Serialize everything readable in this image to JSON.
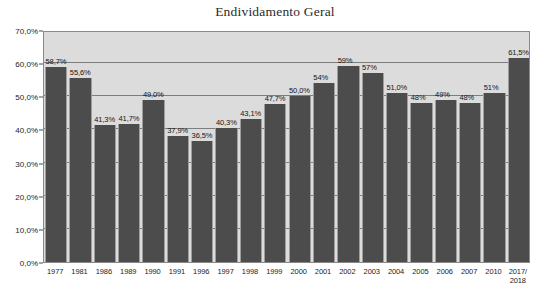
{
  "chart_data": {
    "type": "bar",
    "title": "Endividamento Geral",
    "xlabel": "",
    "ylabel": "",
    "ylim": [
      0,
      70
    ],
    "grid": true,
    "legend": false,
    "categories": [
      "1977",
      "1981",
      "1986",
      "1989",
      "1990",
      "1991",
      "1996",
      "1997",
      "1998",
      "1999",
      "2000",
      "2001",
      "2002",
      "2003",
      "2004",
      "2005",
      "2006",
      "2007",
      "2010",
      "2017/\n2018"
    ],
    "values": [
      58.7,
      55.6,
      41.3,
      41.7,
      49.0,
      37.9,
      36.5,
      40.3,
      43.1,
      47.7,
      50.0,
      54.0,
      59.0,
      57.0,
      51.0,
      48.0,
      49.0,
      48.0,
      51.0,
      61.5
    ],
    "data_labels": [
      "58,7%",
      "55,6%",
      "41,3%",
      "41,7%",
      "49,0%",
      "37,9%",
      "36,5%",
      "40,3%",
      "43,1%",
      "47,7%",
      "50,0%",
      "54%",
      "59%",
      "57%",
      "51,0%",
      "48%",
      "49%",
      "48%",
      "51%",
      "61,5%"
    ],
    "y_ticks": [
      "0,0%",
      "10,0%",
      "20,0%",
      "30,0%",
      "40,0%",
      "50,0%",
      "60,0%",
      "70,0%"
    ],
    "y_tick_values": [
      0,
      10,
      20,
      30,
      40,
      50,
      60,
      70
    ],
    "colors": {
      "bar": "#4c4c4c",
      "plot_background": "#dcdcdc",
      "gridline": "#7d7d7d",
      "axis": "#8a8a8a",
      "text": "#1c1c1c",
      "page_background": "#ffffff"
    }
  }
}
